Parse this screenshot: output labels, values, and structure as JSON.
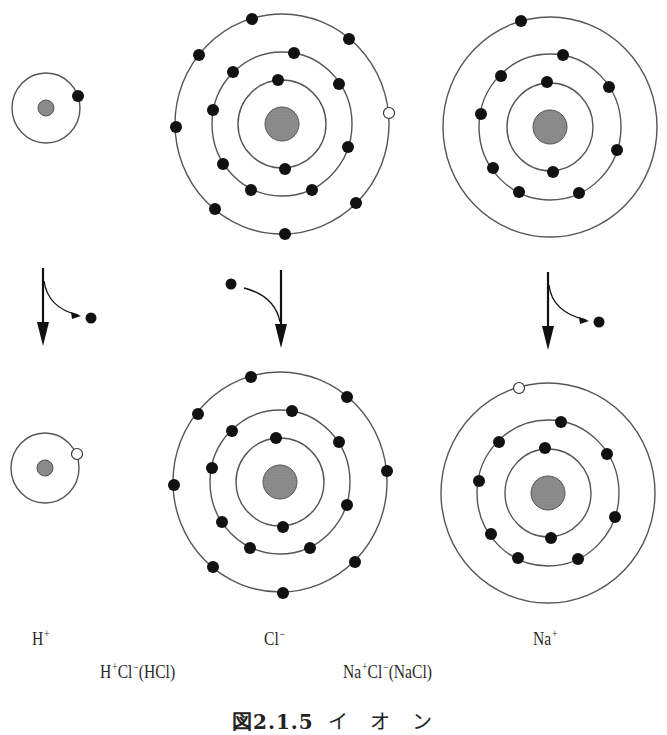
{
  "figure": {
    "caption_prefix": "図2.1.5",
    "caption_title": "イ　オ　ン"
  },
  "colors": {
    "orbit": "#555555",
    "electron": "#111111",
    "hole_fill": "#ffffff",
    "nucleus": "#8a8a8a",
    "nucleus_stroke": "#555555",
    "arrow": "#111111"
  },
  "labels": {
    "h_ion": {
      "base": "H",
      "charge": "+"
    },
    "cl_ion": {
      "base": "Cl",
      "charge": "−"
    },
    "na_ion": {
      "base": "Na",
      "charge": "+"
    },
    "hcl": {
      "p1": "H",
      "c1": "+",
      "p2": "Cl",
      "c2": "−",
      "p3": "(HCl)"
    },
    "nacl": {
      "p1": "Na",
      "c1": "+",
      "p2": "Cl",
      "c2": "−",
      "p3": "(NaCl)"
    }
  },
  "atoms": [
    {
      "id": "h-atom",
      "element": "H",
      "state": "neutral",
      "cx": 46,
      "cy": 108,
      "nucleus_r": 8,
      "orbits": [
        [
          34,
          35
        ]
      ],
      "electrons": [
        [
          78,
          96
        ]
      ],
      "holes": []
    },
    {
      "id": "cl-atom",
      "element": "Cl",
      "state": "neutral",
      "cx": 282,
      "cy": 124,
      "nucleus_r": 17,
      "orbits": [
        [
          44,
          44
        ],
        [
          70,
          72
        ],
        [
          107,
          110
        ]
      ],
      "electrons": [
        [
          278,
          80
        ],
        [
          285,
          169
        ],
        [
          294,
          53
        ],
        [
          339,
          84
        ],
        [
          348,
          147
        ],
        [
          312,
          190
        ],
        [
          251,
          190
        ],
        [
          223,
          164
        ],
        [
          213,
          110
        ],
        [
          233,
          72
        ],
        [
          252,
          19
        ],
        [
          349,
          39
        ],
        [
          356,
          203
        ],
        [
          285,
          234
        ],
        [
          215,
          209
        ],
        [
          176,
          127
        ],
        [
          199,
          55
        ]
      ],
      "holes": [
        [
          389,
          113
        ]
      ]
    },
    {
      "id": "na-atom",
      "element": "Na",
      "state": "neutral",
      "cx": 550,
      "cy": 127,
      "nucleus_r": 17,
      "orbits": [
        [
          43,
          44
        ],
        [
          71,
          73
        ],
        [
          107,
          110
        ]
      ],
      "electrons": [
        [
          547,
          82
        ],
        [
          553,
          172
        ],
        [
          563,
          55
        ],
        [
          609,
          87
        ],
        [
          617,
          150
        ],
        [
          579,
          193
        ],
        [
          519,
          192
        ],
        [
          493,
          168
        ],
        [
          481,
          114
        ],
        [
          501,
          76
        ],
        [
          521,
          21
        ]
      ],
      "holes": []
    },
    {
      "id": "h-ion",
      "element": "H+",
      "state": "ion",
      "cx": 45,
      "cy": 468,
      "nucleus_r": 8,
      "orbits": [
        [
          34,
          35
        ]
      ],
      "electrons": [],
      "holes": [
        [
          77,
          454
        ]
      ]
    },
    {
      "id": "cl-ion",
      "element": "Cl-",
      "state": "ion",
      "cx": 280,
      "cy": 482,
      "nucleus_r": 17,
      "orbits": [
        [
          44,
          44
        ],
        [
          70,
          72
        ],
        [
          107,
          110
        ]
      ],
      "electrons": [
        [
          276,
          438
        ],
        [
          283,
          527
        ],
        [
          292,
          411
        ],
        [
          339,
          442
        ],
        [
          347,
          505
        ],
        [
          310,
          548
        ],
        [
          250,
          548
        ],
        [
          222,
          522
        ],
        [
          212,
          468
        ],
        [
          232,
          431
        ],
        [
          251,
          377
        ],
        [
          347,
          397
        ],
        [
          387,
          471
        ],
        [
          355,
          562
        ],
        [
          283,
          593
        ],
        [
          213,
          567
        ],
        [
          174,
          485
        ],
        [
          198,
          414
        ]
      ],
      "holes": []
    },
    {
      "id": "na-ion",
      "element": "Na+",
      "state": "ion",
      "cx": 548,
      "cy": 493,
      "nucleus_r": 17,
      "orbits": [
        [
          43,
          44
        ],
        [
          71,
          73
        ],
        [
          107,
          110
        ]
      ],
      "electrons": [
        [
          545,
          448
        ],
        [
          551,
          538
        ],
        [
          561,
          422
        ],
        [
          607,
          454
        ],
        [
          615,
          517
        ],
        [
          578,
          559
        ],
        [
          518,
          558
        ],
        [
          491,
          534
        ],
        [
          479,
          481
        ],
        [
          499,
          442
        ]
      ],
      "holes": [
        [
          519,
          388
        ]
      ]
    }
  ],
  "transitions": [
    {
      "id": "h-transition",
      "direction": "electron-out",
      "x": 43,
      "y1": 268,
      "y2": 346,
      "curve": "M44 281 Q48 308 78 315",
      "electron": [
        91,
        318
      ]
    },
    {
      "id": "cl-transition",
      "direction": "electron-in",
      "x": 281,
      "y1": 270,
      "y2": 348,
      "curve": "M244 288 Q275 296 280 322",
      "electron": [
        231,
        284
      ]
    },
    {
      "id": "na-transition",
      "direction": "electron-out",
      "x": 548,
      "y1": 272,
      "y2": 350,
      "curve": "M549 285 Q552 312 586 320",
      "electron": [
        599,
        322
      ]
    }
  ]
}
